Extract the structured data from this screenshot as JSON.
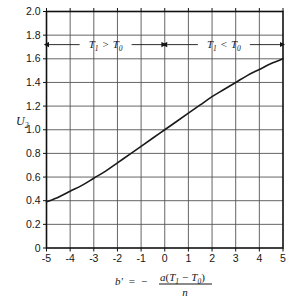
{
  "chart_data": {
    "type": "line",
    "title": "",
    "subtitle": "",
    "xlabel_parts": {
      "lhs": "b'",
      "equals": "=",
      "minus": "−",
      "numerator_a": "a",
      "numerator_open": "(",
      "numerator_T1": "T",
      "numerator_T1_sub": "1",
      "numerator_op": "−",
      "numerator_T0": "T",
      "numerator_T0_sub": "0",
      "numerator_close": ")",
      "denominator": "n"
    },
    "ylabel": "U",
    "ylabel_sub": "2",
    "xlim": [
      -5,
      5
    ],
    "ylim": [
      0,
      2.0
    ],
    "xticks": [
      -5,
      -4,
      -3,
      -2,
      -1,
      0,
      1,
      2,
      3,
      4,
      5
    ],
    "xtick_labels": [
      "-5",
      "-4",
      "-3",
      "-2",
      "-1",
      "0",
      "1",
      "2",
      "3",
      "4",
      "5"
    ],
    "yticks": [
      0,
      0.2,
      0.4,
      0.6,
      0.8,
      1.0,
      1.2,
      1.4,
      1.6,
      1.8,
      2.0
    ],
    "ytick_labels": [
      "0",
      "0.2",
      "0.4",
      "0.6",
      "0.8",
      "1.0",
      "1.2",
      "1.4",
      "1.6",
      "1.8",
      "2.0"
    ],
    "grid": true,
    "legend": "none",
    "series": [
      {
        "name": "U2 vs b'",
        "x": [
          -5,
          -4.5,
          -4,
          -3.5,
          -3,
          -2.5,
          -2,
          -1.5,
          -1,
          -0.5,
          0,
          0.5,
          1,
          1.5,
          2,
          2.5,
          3,
          3.5,
          4,
          4.5,
          5
        ],
        "values": [
          0.39,
          0.43,
          0.48,
          0.53,
          0.59,
          0.65,
          0.72,
          0.79,
          0.86,
          0.93,
          1.0,
          1.07,
          1.14,
          1.21,
          1.28,
          1.34,
          1.4,
          1.46,
          1.51,
          1.56,
          1.6
        ]
      }
    ],
    "annotations": [
      {
        "id": "left-region",
        "text_T": "T",
        "text_T_sub": "1",
        "operator": ">",
        "text_T2": "T",
        "text_T2_sub": "0",
        "label": "T1 > T0",
        "x_start": -5,
        "x_end": 0,
        "y": 1.72,
        "arrow": "double"
      },
      {
        "id": "right-region",
        "text_T": "T",
        "text_T_sub": "1",
        "operator": "<",
        "text_T2": "T",
        "text_T2_sub": "0",
        "label": "T1 < T0",
        "x_start": 0,
        "x_end": 5,
        "y": 1.72,
        "arrow": "double"
      }
    ],
    "colors": {
      "curve": "#1a1a1a",
      "grid": "#555555",
      "axis": "#111111",
      "background": "#ffffff",
      "text": "#161616"
    }
  }
}
